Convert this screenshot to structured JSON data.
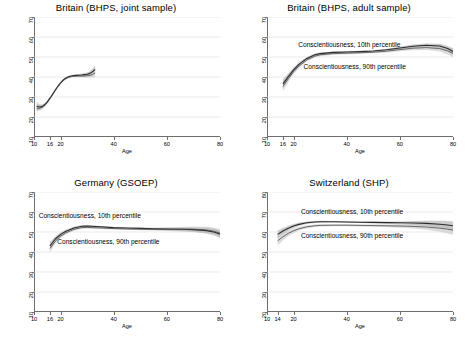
{
  "figure": {
    "axis_label_y": "Predicted Political Interest",
    "axis_label_x": "Age",
    "band_color": "#b9b9b9",
    "line_color": "#4a4a4a",
    "line_color_dark": "#2b2b2b",
    "grid_color": "#dcdcdc",
    "frame_color": "#6e6e6e"
  },
  "chart_data": [
    {
      "type": "line",
      "panel": "top-left",
      "title": "Britain (BHPS, joint sample)",
      "xlabel": "Age",
      "ylabel": "Predicted Political Interest",
      "xlim": [
        10,
        80
      ],
      "ylim": [
        10,
        70
      ],
      "xticks": [
        10,
        16,
        20,
        40,
        60,
        80
      ],
      "yticks": [
        10,
        20,
        30,
        40,
        50,
        60,
        70
      ],
      "grid": true,
      "legend": "none",
      "annotations": [],
      "series": [
        {
          "name": "Conscientiousness, 10th percentile",
          "x": [
            11,
            12,
            13,
            14,
            15,
            16,
            17,
            18,
            19,
            20,
            21,
            22,
            23,
            24,
            25,
            26,
            27,
            28,
            29,
            30,
            31,
            32,
            33
          ],
          "values": [
            25.4,
            25.0,
            25.2,
            26.1,
            27.6,
            29.4,
            31.4,
            33.5,
            35.4,
            37.1,
            38.5,
            39.5,
            40.1,
            40.5,
            40.7,
            40.8,
            40.9,
            41.0,
            41.2,
            41.4,
            41.8,
            42.6,
            43.8
          ],
          "ci_low": [
            23.4,
            23.6,
            24.2,
            25.3,
            26.9,
            28.8,
            30.9,
            33.0,
            35.0,
            36.7,
            38.1,
            39.1,
            39.7,
            40.0,
            40.2,
            40.2,
            40.3,
            40.3,
            40.4,
            40.5,
            40.7,
            41.1,
            41.8
          ],
          "ci_high": [
            27.4,
            26.4,
            26.2,
            26.9,
            28.3,
            30.0,
            31.9,
            34.0,
            35.8,
            37.5,
            38.9,
            39.9,
            40.5,
            41.0,
            41.2,
            41.4,
            41.5,
            41.7,
            42.0,
            42.3,
            42.9,
            44.1,
            45.8
          ]
        },
        {
          "name": "Conscientiousness, 90th percentile",
          "x": [
            11,
            12,
            13,
            14,
            15,
            16,
            17,
            18,
            19,
            20,
            21,
            22,
            23,
            24,
            25,
            26,
            27,
            28,
            29,
            30,
            31,
            32,
            33
          ],
          "values": [
            24.4,
            24.3,
            24.8,
            25.8,
            27.3,
            29.1,
            31.1,
            33.2,
            35.1,
            36.8,
            38.2,
            39.2,
            39.8,
            40.2,
            40.4,
            40.4,
            40.5,
            40.5,
            40.5,
            40.6,
            40.8,
            41.2,
            42.0
          ],
          "ci_low": [
            22.6,
            23.0,
            23.8,
            25.0,
            26.6,
            28.5,
            30.6,
            32.7,
            34.7,
            36.4,
            37.8,
            38.8,
            39.4,
            39.7,
            39.9,
            39.9,
            39.9,
            39.8,
            39.7,
            39.6,
            39.6,
            39.7,
            40.0
          ],
          "ci_high": [
            26.2,
            25.6,
            25.8,
            26.6,
            28.0,
            29.7,
            31.6,
            33.7,
            35.5,
            37.2,
            38.6,
            39.6,
            40.2,
            40.7,
            40.9,
            40.9,
            41.1,
            41.2,
            41.3,
            41.6,
            42.0,
            42.7,
            44.0
          ]
        }
      ]
    },
    {
      "type": "line",
      "panel": "top-right",
      "title": "Britain (BHPS, adult sample)",
      "xlabel": "Age",
      "ylabel": "Predicted Political Interest",
      "xlim": [
        10,
        80
      ],
      "ylim": [
        10,
        70
      ],
      "xticks": [
        10,
        16,
        20,
        40,
        60,
        80
      ],
      "yticks": [
        10,
        20,
        30,
        40,
        50,
        60,
        70
      ],
      "grid": true,
      "legend": "inline-annotations",
      "annotations": [
        {
          "text": "Conscientiousness, 10th percentile",
          "x": 41,
          "y": 56
        },
        {
          "text": "Conscientiousness, 90th percentile",
          "x": 43,
          "y": 45
        }
      ],
      "series": [
        {
          "name": "Conscientiousness, 10th percentile",
          "x": [
            16,
            18,
            20,
            22,
            25,
            28,
            30,
            35,
            40,
            45,
            50,
            55,
            60,
            65,
            70,
            75,
            78,
            80
          ],
          "values": [
            36.6,
            40.2,
            43.6,
            46.3,
            49.3,
            51.1,
            51.7,
            52.3,
            52.5,
            52.7,
            53.0,
            53.6,
            54.5,
            55.4,
            55.9,
            55.5,
            54.2,
            52.8
          ],
          "ci_low": [
            34.3,
            38.6,
            42.5,
            45.4,
            48.6,
            50.5,
            51.1,
            51.8,
            52.1,
            52.3,
            52.6,
            53.1,
            53.9,
            54.6,
            55.0,
            54.4,
            52.9,
            51.2
          ],
          "ci_high": [
            38.9,
            41.8,
            44.7,
            47.2,
            50.0,
            51.7,
            52.3,
            52.8,
            52.9,
            53.1,
            53.4,
            54.1,
            55.1,
            56.2,
            56.8,
            56.6,
            55.5,
            54.4
          ]
        },
        {
          "name": "Conscientiousness, 90th percentile",
          "x": [
            16,
            18,
            20,
            22,
            25,
            28,
            30,
            35,
            40,
            45,
            50,
            55,
            60,
            65,
            70,
            75,
            78,
            80
          ],
          "values": [
            35.3,
            39.1,
            42.6,
            45.4,
            48.5,
            50.4,
            51.1,
            51.7,
            51.9,
            52.1,
            52.4,
            52.9,
            53.7,
            54.4,
            54.7,
            54.2,
            53.0,
            51.8
          ],
          "ci_low": [
            33.0,
            37.4,
            41.4,
            44.4,
            47.7,
            49.7,
            50.4,
            51.1,
            51.4,
            51.6,
            51.9,
            52.3,
            52.9,
            53.4,
            53.5,
            52.7,
            51.3,
            49.9
          ],
          "ci_high": [
            37.6,
            40.8,
            43.8,
            46.4,
            49.3,
            51.1,
            51.8,
            52.3,
            52.4,
            52.6,
            52.9,
            53.5,
            54.5,
            55.4,
            55.9,
            55.7,
            54.7,
            53.7
          ]
        }
      ]
    },
    {
      "type": "line",
      "panel": "bottom-left",
      "title": "Germany (GSOEP)",
      "xlabel": "Age",
      "ylabel": "Predicted Political Interest",
      "xlim": [
        10,
        80
      ],
      "ylim": [
        10,
        70
      ],
      "xticks": [
        10,
        16,
        20,
        40,
        60,
        80
      ],
      "yticks": [
        10,
        20,
        30,
        40,
        50,
        60,
        70
      ],
      "grid": true,
      "legend": "inline-annotations",
      "annotations": [
        {
          "text": "Conscientiousness, 10th percentile",
          "x": 31,
          "y": 58
        },
        {
          "text": "Conscientiousness, 90th percentile",
          "x": 38,
          "y": 45
        }
      ],
      "series": [
        {
          "name": "Conscientiousness, 10th percentile",
          "x": [
            16,
            18,
            20,
            22,
            25,
            28,
            30,
            35,
            40,
            45,
            50,
            55,
            60,
            65,
            70,
            75,
            78,
            80
          ],
          "values": [
            43.0,
            46.5,
            48.8,
            50.4,
            52.0,
            52.9,
            53.0,
            52.6,
            52.2,
            52.0,
            51.8,
            51.6,
            51.5,
            51.4,
            51.2,
            50.7,
            49.9,
            48.9
          ],
          "ci_low": [
            41.0,
            45.2,
            47.9,
            49.7,
            51.4,
            52.4,
            52.5,
            52.2,
            51.9,
            51.7,
            51.4,
            51.1,
            50.8,
            50.5,
            50.1,
            49.3,
            48.3,
            47.1
          ],
          "ci_high": [
            45.0,
            47.8,
            49.7,
            51.1,
            52.6,
            53.4,
            53.5,
            53.0,
            52.5,
            52.3,
            52.2,
            52.1,
            52.2,
            52.3,
            52.3,
            52.1,
            51.5,
            50.7
          ]
        },
        {
          "name": "Conscientiousness, 90th percentile",
          "x": [
            16,
            18,
            20,
            22,
            25,
            28,
            30,
            35,
            40,
            45,
            50,
            55,
            60,
            65,
            70,
            75,
            78,
            80
          ],
          "values": [
            41.8,
            45.4,
            47.9,
            49.6,
            51.3,
            52.2,
            52.3,
            52.0,
            51.7,
            51.5,
            51.4,
            51.3,
            51.3,
            51.4,
            51.4,
            51.0,
            50.3,
            49.4
          ],
          "ci_low": [
            39.7,
            44.0,
            46.9,
            48.8,
            50.6,
            51.6,
            51.8,
            51.5,
            51.3,
            51.1,
            50.9,
            50.7,
            50.5,
            50.3,
            50.0,
            49.4,
            48.5,
            47.4
          ],
          "ci_high": [
            43.9,
            46.8,
            48.9,
            50.4,
            52.0,
            52.8,
            52.8,
            52.5,
            52.1,
            51.9,
            51.9,
            51.9,
            52.1,
            52.5,
            52.8,
            52.6,
            52.1,
            51.4
          ]
        }
      ]
    },
    {
      "type": "line",
      "panel": "bottom-right",
      "title": "Switzerland (SHP)",
      "xlabel": "Age",
      "ylabel": "Predicted Political Interest",
      "xlim": [
        10,
        80
      ],
      "ylim": [
        20,
        80
      ],
      "xticks": [
        10,
        14,
        20,
        40,
        60,
        80
      ],
      "yticks": [
        20,
        30,
        40,
        50,
        60,
        70,
        80
      ],
      "grid": true,
      "legend": "inline-annotations",
      "annotations": [
        {
          "text": "Conscientiousness, 10th percentile",
          "x": 42,
          "y": 70
        },
        {
          "text": "Conscientiousness, 90th percentile",
          "x": 42,
          "y": 58
        }
      ],
      "series": [
        {
          "name": "Conscientiousness, 10th percentile",
          "x": [
            14,
            16,
            18,
            20,
            22,
            25,
            28,
            30,
            35,
            40,
            45,
            50,
            55,
            60,
            65,
            70,
            75,
            78,
            80
          ],
          "values": [
            58.8,
            60.5,
            61.9,
            63.0,
            63.8,
            64.6,
            65.0,
            65.1,
            65.1,
            65.0,
            64.9,
            64.8,
            64.7,
            64.6,
            64.5,
            64.3,
            63.9,
            63.5,
            63.1
          ],
          "ci_low": [
            56.8,
            59.0,
            60.7,
            62.0,
            63.0,
            64.0,
            64.5,
            64.6,
            64.7,
            64.6,
            64.5,
            64.3,
            64.1,
            63.9,
            63.5,
            63.0,
            62.2,
            61.5,
            60.9
          ],
          "ci_high": [
            60.8,
            62.0,
            63.1,
            64.0,
            64.6,
            65.2,
            65.5,
            65.6,
            65.5,
            65.4,
            65.3,
            65.3,
            65.3,
            65.3,
            65.5,
            65.6,
            65.6,
            65.5,
            65.3
          ]
        },
        {
          "name": "Conscientiousness, 90th percentile",
          "x": [
            14,
            16,
            18,
            20,
            22,
            25,
            28,
            30,
            35,
            40,
            45,
            50,
            55,
            60,
            65,
            70,
            75,
            78,
            80
          ],
          "values": [
            55.6,
            57.6,
            59.3,
            60.6,
            61.6,
            62.6,
            63.1,
            63.3,
            63.4,
            63.4,
            63.3,
            63.2,
            63.1,
            63.0,
            62.8,
            62.5,
            61.9,
            61.4,
            60.9
          ],
          "ci_low": [
            53.2,
            55.8,
            57.9,
            59.5,
            60.7,
            61.9,
            62.5,
            62.7,
            62.9,
            62.9,
            62.8,
            62.6,
            62.4,
            62.1,
            61.7,
            61.1,
            60.1,
            59.3,
            58.6
          ],
          "ci_high": [
            58.0,
            59.4,
            60.7,
            61.7,
            62.5,
            63.3,
            63.7,
            63.9,
            63.9,
            63.9,
            63.8,
            63.8,
            63.8,
            63.9,
            63.9,
            63.9,
            63.7,
            63.5,
            63.2
          ]
        }
      ]
    }
  ]
}
